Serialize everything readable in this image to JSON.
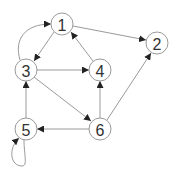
{
  "diagram": {
    "type": "directed-graph",
    "colors": {
      "edge": "#9a9a9a",
      "arrow": "#222222",
      "node_stroke": "#9a9a9a",
      "label": "#333333"
    },
    "nodes": [
      {
        "id": "1",
        "label": "1",
        "x": 62,
        "y": 24
      },
      {
        "id": "2",
        "label": "2",
        "x": 157,
        "y": 43
      },
      {
        "id": "3",
        "label": "3",
        "x": 26,
        "y": 70
      },
      {
        "id": "4",
        "label": "4",
        "x": 100,
        "y": 70
      },
      {
        "id": "5",
        "label": "5",
        "x": 26,
        "y": 129
      },
      {
        "id": "6",
        "label": "6",
        "x": 100,
        "y": 129
      }
    ],
    "edges": [
      {
        "from": "1",
        "to": "2"
      },
      {
        "from": "1",
        "to": "3"
      },
      {
        "from": "3",
        "to": "1",
        "curved": true
      },
      {
        "from": "3",
        "to": "4"
      },
      {
        "from": "3",
        "to": "6"
      },
      {
        "from": "4",
        "to": "1"
      },
      {
        "from": "6",
        "to": "4"
      },
      {
        "from": "6",
        "to": "2"
      },
      {
        "from": "6",
        "to": "5"
      },
      {
        "from": "5",
        "to": "3"
      },
      {
        "from": "5",
        "to": "5",
        "self_loop": true
      }
    ]
  }
}
